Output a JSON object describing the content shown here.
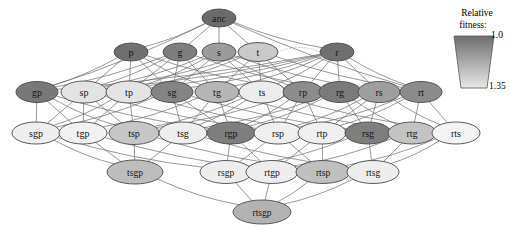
{
  "figure": {
    "background_color": "#ffffff"
  },
  "legend": {
    "name": "relative-fitness-legend",
    "title_line1": "Relative",
    "title_line2": "fitness:",
    "top_value": "1.0",
    "bottom_value": "1.35",
    "top_color": "#6e6e6e",
    "bottom_color": "#e8e8e8"
  },
  "graph": {
    "node_rx": 21,
    "node_ry": 10.5,
    "rows": [
      {
        "index": 0,
        "y": 18,
        "nodes": [
          {
            "id": "anc",
            "label": "anc",
            "x": 219,
            "fill": "#6a6a6a",
            "text_color": "#1a1a1a",
            "rx": 17,
            "ry": 9
          }
        ]
      },
      {
        "index": 1,
        "y": 52,
        "nodes": [
          {
            "id": "p",
            "label": "p",
            "x": 131,
            "fill": "#6f6f6f",
            "text_color": "#151515",
            "rx": 17,
            "ry": 9
          },
          {
            "id": "g",
            "label": "g",
            "x": 180,
            "fill": "#7d7d7d",
            "text_color": "#151515",
            "rx": 17,
            "ry": 9
          },
          {
            "id": "s",
            "label": "s",
            "x": 219,
            "fill": "#9b9b9b",
            "text_color": "#151515",
            "rx": 17,
            "ry": 9
          },
          {
            "id": "t",
            "label": "t",
            "x": 258,
            "fill": "#c9c9c9",
            "text_color": "#151515",
            "rx": 20,
            "ry": 9.5
          },
          {
            "id": "r",
            "label": "r",
            "x": 337,
            "fill": "#6f6f6f",
            "text_color": "#151515",
            "rx": 17,
            "ry": 9
          }
        ]
      },
      {
        "index": 2,
        "y": 92,
        "nodes": [
          {
            "id": "gp",
            "label": "gp",
            "x": 37,
            "fill": "#787878",
            "text_color": "#141414",
            "rx": 21,
            "ry": 10.5
          },
          {
            "id": "sp",
            "label": "sp",
            "x": 84,
            "fill": "#e3e3e3",
            "text_color": "#141414",
            "rx": 23,
            "ry": 11
          },
          {
            "id": "tp",
            "label": "tp",
            "x": 129,
            "fill": "#e3e3e3",
            "text_color": "#141414",
            "rx": 23,
            "ry": 11
          },
          {
            "id": "sg",
            "label": "sg",
            "x": 172,
            "fill": "#848484",
            "text_color": "#141414",
            "rx": 21,
            "ry": 10.5
          },
          {
            "id": "tg",
            "label": "tg",
            "x": 217,
            "fill": "#b5b5b5",
            "text_color": "#141414",
            "rx": 22,
            "ry": 10.5
          },
          {
            "id": "ts",
            "label": "ts",
            "x": 262,
            "fill": "#ececec",
            "text_color": "#141414",
            "rx": 23,
            "ry": 11
          },
          {
            "id": "rp",
            "label": "rp",
            "x": 303,
            "fill": "#8c8c8c",
            "text_color": "#141414",
            "rx": 20,
            "ry": 10.5
          },
          {
            "id": "rg",
            "label": "rg",
            "x": 340,
            "fill": "#7a7a7a",
            "text_color": "#141414",
            "rx": 21,
            "ry": 10.5
          },
          {
            "id": "rs",
            "label": "rs",
            "x": 379,
            "fill": "#9e9e9e",
            "text_color": "#141414",
            "rx": 21,
            "ry": 10.5
          },
          {
            "id": "rt",
            "label": "rt",
            "x": 421,
            "fill": "#8b8b8b",
            "text_color": "#141414",
            "rx": 21,
            "ry": 10.5
          }
        ]
      },
      {
        "index": 3,
        "y": 133,
        "nodes": [
          {
            "id": "sgp",
            "label": "sgp",
            "x": 36,
            "fill": "#eeeeee",
            "text_color": "#141414",
            "rx": 24,
            "ry": 11
          },
          {
            "id": "tgp",
            "label": "tgp",
            "x": 83,
            "fill": "#f1f1f1",
            "text_color": "#141414",
            "rx": 24,
            "ry": 11
          },
          {
            "id": "tsp",
            "label": "tsp",
            "x": 134,
            "fill": "#c6c6c6",
            "text_color": "#141414",
            "rx": 25,
            "ry": 11.5
          },
          {
            "id": "tsg",
            "label": "tsg",
            "x": 183,
            "fill": "#eeeeee",
            "text_color": "#141414",
            "rx": 24,
            "ry": 11
          },
          {
            "id": "rgp",
            "label": "rgp",
            "x": 231,
            "fill": "#7e7e7e",
            "text_color": "#141414",
            "rx": 24,
            "ry": 11
          },
          {
            "id": "rsp",
            "label": "rsp",
            "x": 278,
            "fill": "#efefef",
            "text_color": "#141414",
            "rx": 24,
            "ry": 11
          },
          {
            "id": "rtp",
            "label": "rtp",
            "x": 322,
            "fill": "#efefef",
            "text_color": "#141414",
            "rx": 24,
            "ry": 11
          },
          {
            "id": "rsg",
            "label": "rsg",
            "x": 368,
            "fill": "#7e7e7e",
            "text_color": "#141414",
            "rx": 23,
            "ry": 11
          },
          {
            "id": "rtg",
            "label": "rtg",
            "x": 412,
            "fill": "#c3c3c3",
            "text_color": "#141414",
            "rx": 24,
            "ry": 11
          },
          {
            "id": "rts",
            "label": "rts",
            "x": 456,
            "fill": "#f3f3f3",
            "text_color": "#141414",
            "rx": 24,
            "ry": 11
          }
        ]
      },
      {
        "index": 4,
        "y": 172,
        "nodes": [
          {
            "id": "tsgp",
            "label": "tsgp",
            "x": 135,
            "fill": "#bdbdbd",
            "text_color": "#141414",
            "rx": 28,
            "ry": 12
          },
          {
            "id": "rsgp",
            "label": "rsgp",
            "x": 226,
            "fill": "#ededed",
            "text_color": "#141414",
            "rx": 26,
            "ry": 11.5
          },
          {
            "id": "rtgp",
            "label": "rtgp",
            "x": 272,
            "fill": "#ededed",
            "text_color": "#141414",
            "rx": 26,
            "ry": 11.5
          },
          {
            "id": "rtsp",
            "label": "rtsp",
            "x": 323,
            "fill": "#bfbfbf",
            "text_color": "#141414",
            "rx": 27,
            "ry": 11.5
          },
          {
            "id": "rtsg",
            "label": "rtsg",
            "x": 373,
            "fill": "#ededed",
            "text_color": "#141414",
            "rx": 26,
            "ry": 11.5
          }
        ]
      },
      {
        "index": 5,
        "y": 212,
        "nodes": [
          {
            "id": "rtsgp",
            "label": "rtsgp",
            "x": 262,
            "fill": "#b2b2b2",
            "text_color": "#141414",
            "rx": 29,
            "ry": 12
          }
        ]
      }
    ],
    "edges_solid": [
      [
        "anc",
        "p"
      ],
      [
        "anc",
        "g"
      ],
      [
        "anc",
        "s"
      ],
      [
        "anc",
        "t"
      ],
      [
        "anc",
        "r"
      ],
      [
        "anc",
        "gp"
      ],
      [
        "anc",
        "rt"
      ],
      [
        "p",
        "gp"
      ],
      [
        "p",
        "sp"
      ],
      [
        "p",
        "tp"
      ],
      [
        "p",
        "rp"
      ],
      [
        "g",
        "gp"
      ],
      [
        "g",
        "sg"
      ],
      [
        "g",
        "tg"
      ],
      [
        "g",
        "rg"
      ],
      [
        "s",
        "sp"
      ],
      [
        "s",
        "sg"
      ],
      [
        "s",
        "ts"
      ],
      [
        "s",
        "rs"
      ],
      [
        "t",
        "tp"
      ],
      [
        "t",
        "tg"
      ],
      [
        "t",
        "ts"
      ],
      [
        "t",
        "rt"
      ],
      [
        "r",
        "rp"
      ],
      [
        "r",
        "rg"
      ],
      [
        "r",
        "rs"
      ],
      [
        "r",
        "rt"
      ],
      [
        "p",
        "sg"
      ],
      [
        "p",
        "tg"
      ],
      [
        "g",
        "sp"
      ],
      [
        "g",
        "tp"
      ],
      [
        "s",
        "tp"
      ],
      [
        "s",
        "rp"
      ],
      [
        "t",
        "sp"
      ],
      [
        "t",
        "rp"
      ],
      [
        "r",
        "gp"
      ],
      [
        "r",
        "sp"
      ],
      [
        "r",
        "tp"
      ],
      [
        "r",
        "sg"
      ],
      [
        "r",
        "tg"
      ],
      [
        "r",
        "ts"
      ],
      [
        "gp",
        "sgp"
      ],
      [
        "gp",
        "tgp"
      ],
      [
        "gp",
        "rgp"
      ],
      [
        "sp",
        "sgp"
      ],
      [
        "sp",
        "tsp"
      ],
      [
        "sp",
        "rsp"
      ],
      [
        "tp",
        "tgp"
      ],
      [
        "tp",
        "tsp"
      ],
      [
        "tp",
        "rtp"
      ],
      [
        "sg",
        "sgp"
      ],
      [
        "sg",
        "tsg"
      ],
      [
        "sg",
        "rsg"
      ],
      [
        "tg",
        "tgp"
      ],
      [
        "tg",
        "tsg"
      ],
      [
        "tg",
        "rtg"
      ],
      [
        "ts",
        "tsp"
      ],
      [
        "ts",
        "tsg"
      ],
      [
        "ts",
        "rts"
      ],
      [
        "rp",
        "rgp"
      ],
      [
        "rp",
        "rsp"
      ],
      [
        "rp",
        "rtp"
      ],
      [
        "rg",
        "rgp"
      ],
      [
        "rg",
        "rsg"
      ],
      [
        "rg",
        "rtg"
      ],
      [
        "rs",
        "rsp"
      ],
      [
        "rs",
        "rsg"
      ],
      [
        "rs",
        "rts"
      ],
      [
        "rt",
        "rtp"
      ],
      [
        "rt",
        "rtg"
      ],
      [
        "rt",
        "rts"
      ],
      [
        "gp",
        "tsp"
      ],
      [
        "sp",
        "tgp"
      ],
      [
        "tp",
        "sgp"
      ],
      [
        "sg",
        "rgp"
      ],
      [
        "tg",
        "rgp"
      ],
      [
        "ts",
        "rsp"
      ],
      [
        "rp",
        "tsp"
      ],
      [
        "rg",
        "tsg"
      ],
      [
        "rs",
        "rtp"
      ],
      [
        "rt",
        "rsp"
      ],
      [
        "sgp",
        "tsgp"
      ],
      [
        "tgp",
        "tsgp"
      ],
      [
        "tsp",
        "tsgp"
      ],
      [
        "tsg",
        "tsgp"
      ],
      [
        "rgp",
        "rsgp"
      ],
      [
        "rgp",
        "rtgp"
      ],
      [
        "rsp",
        "rsgp"
      ],
      [
        "rsp",
        "rtsp"
      ],
      [
        "rtp",
        "rtgp"
      ],
      [
        "rtp",
        "rtsp"
      ],
      [
        "rsg",
        "rsgp"
      ],
      [
        "rsg",
        "rtsg"
      ],
      [
        "rtg",
        "rtgp"
      ],
      [
        "rtg",
        "rtsg"
      ],
      [
        "rts",
        "rtsp"
      ],
      [
        "rts",
        "rtsg"
      ],
      [
        "sgp",
        "rsgp"
      ],
      [
        "tgp",
        "rtgp"
      ],
      [
        "tsp",
        "rtsp"
      ],
      [
        "tsg",
        "rtsg"
      ],
      [
        "tsgp",
        "rtsgp"
      ],
      [
        "rsgp",
        "rtsgp"
      ],
      [
        "rtgp",
        "rtsgp"
      ],
      [
        "rtsp",
        "rtsgp"
      ],
      [
        "rtsg",
        "rtsgp"
      ]
    ],
    "edges_dotted": [
      [
        "t",
        "r"
      ],
      [
        "sgp",
        "rgp"
      ],
      [
        "tgp",
        "rgp"
      ],
      [
        "tsp",
        "rgp"
      ],
      [
        "tsg",
        "rgp"
      ],
      [
        "rgp",
        "rsp"
      ],
      [
        "rgp",
        "rtp"
      ],
      [
        "rgp",
        "rsg"
      ],
      [
        "rgp",
        "rtg"
      ],
      [
        "rgp",
        "rts"
      ],
      [
        "sp",
        "ts"
      ],
      [
        "tp",
        "ts"
      ]
    ]
  }
}
